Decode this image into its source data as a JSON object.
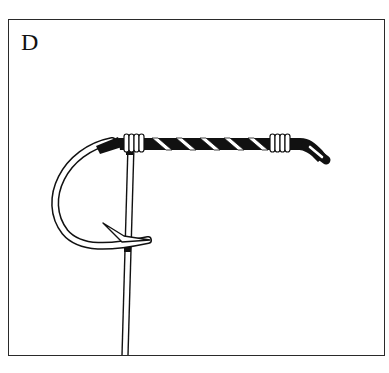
{
  "panel": {
    "label": "D",
    "description": "Fishing knot illustration: line wrapped around a hook shank with a spiral and end wraps, tag line running down",
    "colors": {
      "ink": "#111111",
      "paper": "#ffffff",
      "border": "#2a2a2a"
    }
  },
  "figure": {
    "elements": [
      "hook-bend",
      "hook-barb",
      "hook-shank",
      "spiral-wrap",
      "left-wrap-coils",
      "right-wrap-coils",
      "hook-eye",
      "leader-line"
    ],
    "left_wrap_coil_count": 4,
    "right_wrap_coil_count": 4,
    "spiral_turn_count": 5
  }
}
